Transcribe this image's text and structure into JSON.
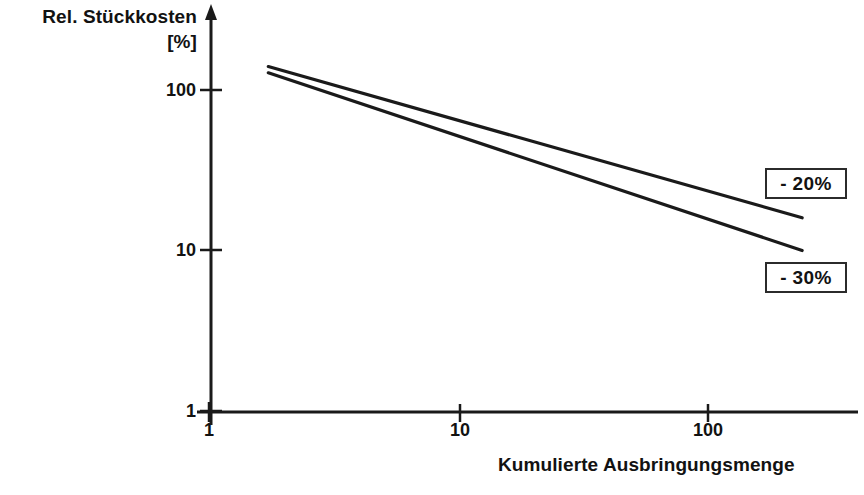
{
  "chart_data": {
    "type": "line",
    "title": "",
    "xlabel": "Kumulierte Ausbringungsmenge",
    "ylabel": "Rel. Stückkosten",
    "yunit": "[%]",
    "xscale": "log",
    "yscale": "log",
    "xlim": [
      1,
      250
    ],
    "ylim": [
      1,
      200
    ],
    "xticks": [
      1,
      10,
      100
    ],
    "xticklabels": [
      "1",
      "10",
      "100"
    ],
    "yticks": [
      1,
      10,
      100
    ],
    "yticklabels": [
      "1",
      "10",
      "100"
    ],
    "grid": false,
    "legend": "inline-annotations",
    "series": [
      {
        "name": "- 20%",
        "label": "- 20%",
        "slope_percent_per_doubling": -20,
        "color": "#1a1a1a",
        "points": [
          {
            "x": 1.73,
            "y": 140
          },
          {
            "x": 240,
            "y": 16
          }
        ]
      },
      {
        "name": "- 30%",
        "label": "- 30%",
        "slope_percent_per_doubling": -30,
        "color": "#1a1a1a",
        "points": [
          {
            "x": 1.73,
            "y": 128
          },
          {
            "x": 240,
            "y": 10
          }
        ]
      }
    ],
    "annotations": [
      {
        "text": "- 20%",
        "series": "- 20%"
      },
      {
        "text": "- 30%",
        "series": "- 30%"
      }
    ]
  },
  "axes": {
    "y_title_main": "Rel. Stückkosten",
    "y_title_unit": "[%]",
    "x_title": "Kumulierte Ausbringungsmenge",
    "y_ticks": [
      {
        "label": "100",
        "top": 80
      },
      {
        "label": "10",
        "top": 240
      },
      {
        "label": "1",
        "top": 401
      }
    ],
    "x_ticks": [
      {
        "label": "1",
        "left": 184
      },
      {
        "label": "10",
        "left": 435
      },
      {
        "label": "100",
        "left": 683
      }
    ]
  },
  "badges": [
    {
      "label": "- 20%",
      "left": 765,
      "top": 168,
      "width": 82,
      "height": 31
    },
    {
      "label": "- 30%",
      "left": 765,
      "top": 262,
      "width": 82,
      "height": 31
    }
  ],
  "colors": {
    "ink": "#1a1a1a",
    "text": "#121212",
    "background": "#ffffff"
  }
}
